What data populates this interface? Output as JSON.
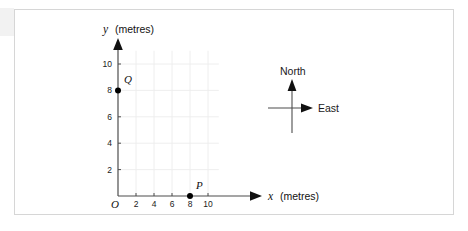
{
  "figure": {
    "background_color": "#ffffff",
    "border_color": "#d6d6d6"
  },
  "chart_data": {
    "type": "scatter",
    "title": "",
    "xlabel_var": "x",
    "xlabel_unit": "(metres)",
    "ylabel_var": "y",
    "ylabel_unit": "(metres)",
    "origin_label": "O",
    "xlim": [
      0,
      11.5
    ],
    "ylim": [
      0,
      11.2
    ],
    "xticks": [
      2,
      4,
      6,
      8,
      10
    ],
    "yticks": [
      2,
      4,
      6,
      8,
      10
    ],
    "xtick_labels": [
      "2",
      "4",
      "6",
      "8",
      "10"
    ],
    "ytick_labels": [
      "2",
      "4",
      "6",
      "8",
      "10"
    ],
    "grid": true,
    "grid_color": "#ececec",
    "grid_spacing": 2,
    "axis_color": "#4d4d4d",
    "point_color": "#000000",
    "legend": "none",
    "points": [
      {
        "label": "P",
        "x": 8,
        "y": 0,
        "label_dx": 6,
        "label_dy": -7
      },
      {
        "label": "Q",
        "x": 0,
        "y": 8,
        "label_dx": 6,
        "label_dy": -7
      }
    ]
  },
  "compass": {
    "north_label": "North",
    "east_label": "East",
    "color": "#1a1a1a"
  }
}
